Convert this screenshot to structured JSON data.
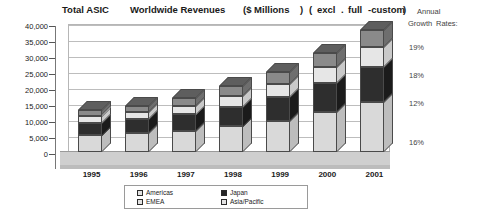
{
  "title": {
    "total": "Total ASIC",
    "worldwide": "Worldwide Revenues",
    "millions": "($ Millions",
    "paren_close_1": ")",
    "paren_open_2": "(",
    "excl": "excl",
    "dot": ".",
    "full": "full",
    "custom": "-custom",
    "paren_close_2": ")"
  },
  "growth_panel": {
    "heading_line1": "Annual",
    "heading_line2": "Growth",
    "heading_line3": "Rates:",
    "rates": [
      "19%",
      "18%",
      "12%",
      "16%"
    ]
  },
  "legend": {
    "items": [
      {
        "label": "Americas",
        "swatch": "light-gray"
      },
      {
        "label": "EMEA",
        "swatch": "light-gray"
      },
      {
        "label": "Japan",
        "swatch": "black"
      },
      {
        "label": "Asia/Pacific",
        "swatch": "light-gray"
      }
    ]
  },
  "chart_data": {
    "type": "bar",
    "xlabel": "",
    "ylabel": "$ Millions",
    "ylim": [
      0,
      40000
    ],
    "ytick_labels": [
      "40,000",
      "35,000",
      "30,000",
      "25,000",
      "20,000",
      "15,000",
      "10,000",
      "5,000",
      "0"
    ],
    "ytick_values": [
      40000,
      35000,
      30000,
      25000,
      20000,
      15000,
      10000,
      5000,
      0
    ],
    "grid": true,
    "stacked": true,
    "legend_position": "bottom",
    "categories": [
      "1995",
      "1996",
      "1997",
      "1998",
      "1999",
      "2000",
      "2001"
    ],
    "series": [
      {
        "name": "Americas",
        "values": [
          5200,
          5800,
          6600,
          8000,
          9800,
          12500,
          15500
        ]
      },
      {
        "name": "Japan",
        "values": [
          4000,
          4400,
          5200,
          6200,
          7400,
          9000,
          11000
        ]
      },
      {
        "name": "EMEA",
        "values": [
          2100,
          2300,
          2700,
          3300,
          4000,
          5000,
          6200
        ]
      },
      {
        "name": "Asia/Pacific",
        "values": [
          1700,
          2000,
          2500,
          3000,
          3800,
          4500,
          5300
        ]
      }
    ],
    "totals": [
      13000,
      14500,
      17000,
      20500,
      25000,
      31000,
      38000
    ],
    "annotations": [
      "19%",
      "18%",
      "12%",
      "16%"
    ]
  }
}
